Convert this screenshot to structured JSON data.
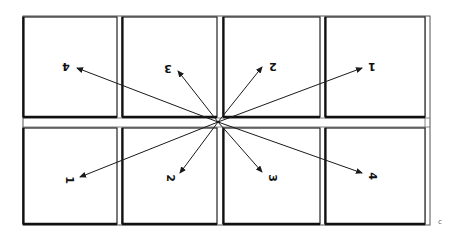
{
  "diagram": {
    "rows": 2,
    "columns": 4,
    "top_row_labels": [
      "4",
      "3",
      "2",
      "1"
    ],
    "bottom_row_labels": [
      "1",
      "2",
      "3",
      "4"
    ],
    "top_row_labels_orientation": "upside-down",
    "bottom_row_labels_orientation": "upright-rotated",
    "corner_mark": "c",
    "colors": {
      "line": "#1a1a1a",
      "background": "#ffffff"
    }
  }
}
